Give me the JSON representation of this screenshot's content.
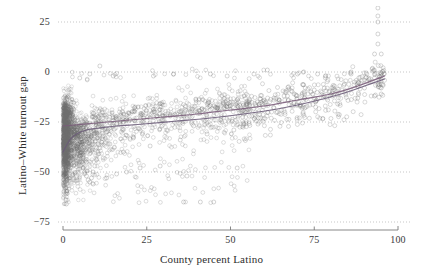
{
  "chart_data": {
    "type": "scatter",
    "title": "",
    "xlabel": "County percent Latino",
    "ylabel": "Latino–White turnout gap",
    "xlim": [
      -3,
      102
    ],
    "ylim": [
      -80,
      34
    ],
    "xticks": [
      0,
      25,
      50,
      75,
      100
    ],
    "xtick_labels": [
      "0",
      "25",
      "50",
      "75",
      "100"
    ],
    "yticks": [
      25,
      0,
      -25,
      -50,
      -75
    ],
    "ytick_labels": [
      "25",
      "0",
      "−25",
      "−50",
      "−75"
    ],
    "grid": true,
    "grid_style": "dotted",
    "grid_color": "#b9b9b9",
    "legend": "none",
    "marker": {
      "shape": "open-circle",
      "color": "#6f6f6f",
      "fill": "none",
      "size": 2.0,
      "opacity": 0.45
    },
    "point_count_approx": 3100,
    "axis_line_color": "#7a7a7a",
    "series": [
      {
        "name": "counties",
        "description": "County-level Latino–White turnout gap vs county percent Latino",
        "x_range": [
          0,
          96
        ],
        "y_range": [
          -66,
          32
        ],
        "density_note": "Extremely dense near x=0 with a vertical spike spanning roughly -66 to -12; spread narrows and rises toward higher percent Latino.",
        "points": [
          [
            0.2,
            -13
          ],
          [
            0.3,
            -18
          ],
          [
            0.3,
            -22
          ],
          [
            0.4,
            -25
          ],
          [
            0.4,
            -28
          ],
          [
            0.5,
            -31
          ],
          [
            0.5,
            -35
          ],
          [
            0.6,
            -39
          ],
          [
            0.6,
            -43
          ],
          [
            0.7,
            -47
          ],
          [
            0.7,
            -51
          ],
          [
            0.8,
            -55
          ],
          [
            0.8,
            -58
          ],
          [
            0.9,
            -61
          ],
          [
            0.9,
            -64
          ],
          [
            1.0,
            -66
          ],
          [
            1.1,
            -60
          ],
          [
            1.2,
            -54
          ],
          [
            1.3,
            -49
          ],
          [
            1.4,
            -44
          ],
          [
            1.5,
            -40
          ],
          [
            1.6,
            -36
          ],
          [
            1.7,
            -33
          ],
          [
            1.8,
            -30
          ],
          [
            1.9,
            -27
          ],
          [
            2.0,
            -24
          ],
          [
            2.2,
            -22
          ],
          [
            2.4,
            -20
          ],
          [
            2.6,
            -19
          ],
          [
            2.8,
            -21
          ],
          [
            3.0,
            -24
          ],
          [
            3.3,
            -27
          ],
          [
            3.6,
            -30
          ],
          [
            4.0,
            -33
          ],
          [
            4.4,
            -36
          ],
          [
            4.8,
            -39
          ],
          [
            5.2,
            -42
          ],
          [
            5.6,
            -45
          ],
          [
            6.0,
            -48
          ],
          [
            6.5,
            -50
          ],
          [
            7.0,
            -52
          ],
          [
            7.5,
            -54
          ],
          [
            8.0,
            -55
          ],
          [
            8.5,
            -53
          ],
          [
            9.0,
            -50
          ],
          [
            9.5,
            -47
          ],
          [
            10,
            -44
          ],
          [
            10.5,
            -41
          ],
          [
            11,
            -38
          ],
          [
            11.5,
            -35
          ],
          [
            12,
            -32
          ],
          [
            13,
            -30
          ],
          [
            14,
            -28
          ],
          [
            15,
            -27
          ],
          [
            16,
            -26
          ],
          [
            17,
            -25
          ],
          [
            18,
            -25
          ],
          [
            19,
            -24
          ],
          [
            20,
            -24
          ],
          [
            22,
            -23
          ],
          [
            24,
            -23
          ],
          [
            26,
            -23
          ],
          [
            28,
            -22
          ],
          [
            30,
            -22
          ],
          [
            32,
            -22
          ],
          [
            34,
            -21
          ],
          [
            36,
            -21
          ],
          [
            38,
            -20
          ],
          [
            40,
            -20
          ],
          [
            42,
            -19
          ],
          [
            44,
            -19
          ],
          [
            46,
            -18
          ],
          [
            48,
            -18
          ],
          [
            50,
            -17
          ],
          [
            52,
            -17
          ],
          [
            55,
            -16
          ],
          [
            58,
            -15
          ],
          [
            60,
            -14
          ],
          [
            63,
            -13
          ],
          [
            66,
            -12
          ],
          [
            69,
            -11
          ],
          [
            72,
            -10
          ],
          [
            75,
            -9
          ],
          [
            78,
            -8
          ],
          [
            81,
            -7
          ],
          [
            84,
            -6
          ],
          [
            87,
            -5
          ],
          [
            90,
            -4
          ],
          [
            93,
            -3
          ],
          [
            95,
            -2
          ],
          [
            11,
            3
          ],
          [
            61,
            1
          ],
          [
            94,
            32
          ],
          [
            94,
            28
          ],
          [
            94,
            25
          ],
          [
            94,
            19
          ],
          [
            94,
            14
          ],
          [
            93,
            9
          ],
          [
            95,
            9
          ],
          [
            86,
            0
          ],
          [
            36,
            -65
          ],
          [
            41,
            -65
          ],
          [
            45,
            -65
          ],
          [
            37,
            -52
          ],
          [
            52,
            -48
          ],
          [
            29,
            -47
          ],
          [
            23,
            -48
          ],
          [
            19,
            -50
          ],
          [
            16,
            -51
          ],
          [
            13,
            -53
          ],
          [
            9,
            -56
          ],
          [
            5,
            -3
          ],
          [
            8,
            -1
          ],
          [
            15,
            -2
          ],
          [
            27,
            -2
          ],
          [
            33,
            -1
          ],
          [
            44,
            -1
          ],
          [
            49,
            -2
          ],
          [
            57,
            -1
          ],
          [
            70,
            -1
          ],
          [
            76,
            -1
          ],
          [
            86,
            -1
          ],
          [
            95,
            -1
          ],
          [
            95,
            -6
          ],
          [
            95,
            -8
          ],
          [
            95,
            -11
          ],
          [
            93,
            -12
          ],
          [
            90,
            -8
          ],
          [
            88,
            -13
          ],
          [
            82,
            -16
          ],
          [
            79,
            -14
          ],
          [
            74,
            -10
          ],
          [
            71,
            -17
          ],
          [
            67,
            -12
          ],
          [
            64,
            -20
          ],
          [
            59,
            -23
          ],
          [
            54,
            -26
          ],
          [
            51,
            -29
          ],
          [
            47,
            -24
          ],
          [
            43,
            -31
          ],
          [
            39,
            -27
          ],
          [
            35,
            -34
          ],
          [
            31,
            -29
          ],
          [
            26,
            -37
          ],
          [
            21,
            -33
          ],
          [
            18,
            -40
          ],
          [
            14,
            -36
          ],
          [
            12,
            -43
          ],
          [
            10,
            -38
          ],
          [
            7,
            -45
          ]
        ]
      }
    ],
    "fits": [
      {
        "name": "fit-line-upper",
        "type": "smoothed-trend",
        "color": "#7a5b7a",
        "description": "Upper trend line rising from about -27 at x=0 to about -2 at x=96, nearly linear with slight upward curvature.",
        "points": [
          [
            0,
            -27
          ],
          [
            10,
            -25.5
          ],
          [
            20,
            -24
          ],
          [
            30,
            -22.5
          ],
          [
            40,
            -21
          ],
          [
            50,
            -19
          ],
          [
            60,
            -17
          ],
          [
            70,
            -14
          ],
          [
            80,
            -11
          ],
          [
            88,
            -7
          ],
          [
            96,
            -2
          ]
        ]
      },
      {
        "name": "fit-line-lower",
        "type": "smoothed-trend",
        "color": "#6a5a78",
        "description": "Lower trend line rising steeply from about -40 at x=0, flattening through the middle, converging with the upper line near x=96.",
        "points": [
          [
            0,
            -40
          ],
          [
            2,
            -34
          ],
          [
            4,
            -31
          ],
          [
            7,
            -29
          ],
          [
            11,
            -28
          ],
          [
            16,
            -27
          ],
          [
            24,
            -26
          ],
          [
            34,
            -24.5
          ],
          [
            44,
            -23
          ],
          [
            54,
            -21
          ],
          [
            64,
            -18.5
          ],
          [
            74,
            -15
          ],
          [
            84,
            -10.5
          ],
          [
            90,
            -7
          ],
          [
            96,
            -3.5
          ]
        ]
      }
    ]
  },
  "axes": {
    "x_title": "County percent Latino",
    "y_title": "Latino–White turnout gap",
    "x_tick_labels": [
      "0",
      "25",
      "50",
      "75",
      "100"
    ],
    "y_tick_labels": [
      "25",
      "0",
      "−25",
      "−50",
      "−75"
    ]
  }
}
